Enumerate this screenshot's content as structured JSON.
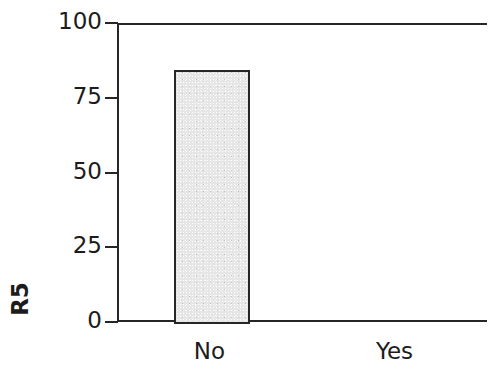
{
  "chart_data": {
    "type": "bar",
    "title": "",
    "subtitle": "",
    "xlabel": "",
    "ylabel": "R5",
    "categories": [
      "No",
      "Yes"
    ],
    "values": [
      85,
      0
    ],
    "ylim": [
      0,
      100
    ],
    "yticks": [
      0,
      25,
      50,
      75,
      100
    ],
    "ytick_labels": [
      "0",
      "25",
      "50",
      "75",
      "100"
    ],
    "grid": false,
    "legend": null,
    "annotations": [],
    "bar_fill_color": "#e6e6e6",
    "bar_edge_color": "#262626",
    "axis_color": "#262626",
    "background_color": "#ffffff"
  }
}
